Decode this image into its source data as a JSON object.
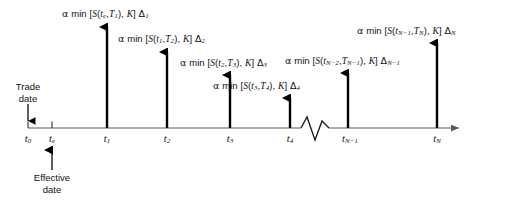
{
  "figure": {
    "type": "timeline-diagram",
    "axis": {
      "y": 128,
      "x_start": 28,
      "x_end": 465,
      "arrow": "right-arrowhead",
      "break_symbol": "zigzag",
      "break_x_range": [
        300,
        330
      ]
    },
    "ticks": [
      {
        "id": "t0",
        "x": 28,
        "label_main": "t",
        "label_sub": "0",
        "has_cashflow": false
      },
      {
        "id": "te",
        "x": 52,
        "label_main": "t",
        "label_sub": "e",
        "has_cashflow": false
      },
      {
        "id": "t1",
        "x": 107,
        "label_main": "t",
        "label_sub": "1",
        "has_cashflow": true
      },
      {
        "id": "t2",
        "x": 167,
        "label_main": "t",
        "label_sub": "2",
        "has_cashflow": true
      },
      {
        "id": "t3",
        "x": 230,
        "label_main": "t",
        "label_sub": "3",
        "has_cashflow": true
      },
      {
        "id": "t4",
        "x": 290,
        "label_main": "t",
        "label_sub": "4",
        "has_cashflow": true
      },
      {
        "id": "tNm1",
        "x": 348,
        "label_main": "t",
        "label_sub": "N−1",
        "has_cashflow": true
      },
      {
        "id": "tN",
        "x": 437,
        "label_main": "t",
        "label_sub": "N",
        "has_cashflow": true
      }
    ],
    "cashflow_arrows": [
      {
        "id": "arrow-t1",
        "x": 107,
        "top_y": 22,
        "label_id": "payoff-1"
      },
      {
        "id": "arrow-t2",
        "x": 167,
        "top_y": 47,
        "label_id": "payoff-2"
      },
      {
        "id": "arrow-t3",
        "x": 230,
        "top_y": 70,
        "label_id": "payoff-3"
      },
      {
        "id": "arrow-t4",
        "x": 290,
        "top_y": 93,
        "label_id": "payoff-4"
      },
      {
        "id": "arrow-tNm1",
        "x": 348,
        "top_y": 68,
        "label_id": "payoff-N-1"
      },
      {
        "id": "arrow-tN",
        "x": 437,
        "top_y": 38,
        "label_id": "payoff-N"
      }
    ],
    "payoff_labels": [
      {
        "id": "payoff-1",
        "x": 62,
        "y": 8,
        "alpha": "α",
        "fn": "min",
        "open": "[",
        "s": "S",
        "arg_open": "(",
        "arg1_main": "t",
        "arg1_sub": "e",
        "comma": ",",
        "arg2_main": "T",
        "arg2_sub": "1",
        "arg_close": ")",
        "comma2": ",",
        "strike": "K",
        "close": "]",
        "delta_main": "Δ",
        "delta_sub": "1",
        "text": "α min [S(te,T1), K] Δ1"
      },
      {
        "id": "payoff-2",
        "x": 118,
        "y": 33,
        "alpha": "α",
        "fn": "min",
        "open": "[",
        "s": "S",
        "arg_open": "(",
        "arg1_main": "t",
        "arg1_sub": "1",
        "comma": ",",
        "arg2_main": "T",
        "arg2_sub": "2",
        "arg_close": ")",
        "comma2": ",",
        "strike": "K",
        "close": "]",
        "delta_main": "Δ",
        "delta_sub": "2",
        "text": "α min [S(t1,T2), K] Δ2"
      },
      {
        "id": "payoff-3",
        "x": 180,
        "y": 57,
        "alpha": "α",
        "fn": "min",
        "open": "[",
        "s": "S",
        "arg_open": "(",
        "arg1_main": "t",
        "arg1_sub": "2",
        "comma": ",",
        "arg2_main": "T",
        "arg2_sub": "3",
        "arg_close": ")",
        "comma2": ",",
        "strike": "K",
        "close": "]",
        "delta_main": "Δ",
        "delta_sub": "3",
        "text": "α min [S(t2,T3), K] Δ3"
      },
      {
        "id": "payoff-4",
        "x": 213,
        "y": 80,
        "alpha": "α",
        "fn": "min",
        "open": "[",
        "s": "S",
        "arg_open": "(",
        "arg1_main": "t",
        "arg1_sub": "3",
        "comma": ",",
        "arg2_main": "T",
        "arg2_sub": "4",
        "arg_close": ")",
        "comma2": ",",
        "strike": "K",
        "close": "]",
        "delta_main": "Δ",
        "delta_sub": "4",
        "text": "α min [S(t3,T4), K] Δ4"
      },
      {
        "id": "payoff-N-1",
        "x": 285,
        "y": 55,
        "alpha": "α",
        "fn": "min",
        "open": "[",
        "s": "S",
        "arg_open": "(",
        "arg1_main": "t",
        "arg1_sub": "N−2",
        "comma": ",",
        "arg2_main": "T",
        "arg2_sub": "N−1",
        "arg_close": ")",
        "comma2": ",",
        "strike": "K",
        "close": "]",
        "delta_main": "Δ",
        "delta_sub": "N−1",
        "text": "α min [S(tN−2,TN−1), K] ΔN−1"
      },
      {
        "id": "payoff-N",
        "x": 357,
        "y": 25,
        "alpha": "α",
        "fn": "min",
        "open": "[",
        "s": "S",
        "arg_open": "(",
        "arg1_main": "t",
        "arg1_sub": "N−1",
        "comma": ",",
        "arg2_main": "T",
        "arg2_sub": "N",
        "arg_close": ")",
        "comma2": ",",
        "strike": "K",
        "close": "]",
        "delta_main": "Δ",
        "delta_sub": "N",
        "text": "α min [S(tN−1,TN), K] ΔN"
      }
    ],
    "annotations": [
      {
        "id": "trade-date",
        "line1": "Trade",
        "line2": "date",
        "x": 28,
        "y": 82,
        "pointer": "down-arrow",
        "pointer_from_y": 105,
        "pointer_to_y": 126,
        "target_tick": "t0"
      },
      {
        "id": "effective-date",
        "line1": "Effective",
        "line2": "date",
        "x": 52,
        "y": 172,
        "pointer": "up-arrow",
        "pointer_from_y": 169,
        "pointer_to_y": 148,
        "target_tick": "te"
      }
    ],
    "colors": {
      "axis": "#5a5a5a",
      "cashflow_arrow": "#000000",
      "text": "#111111",
      "background": "#ffffff"
    }
  }
}
